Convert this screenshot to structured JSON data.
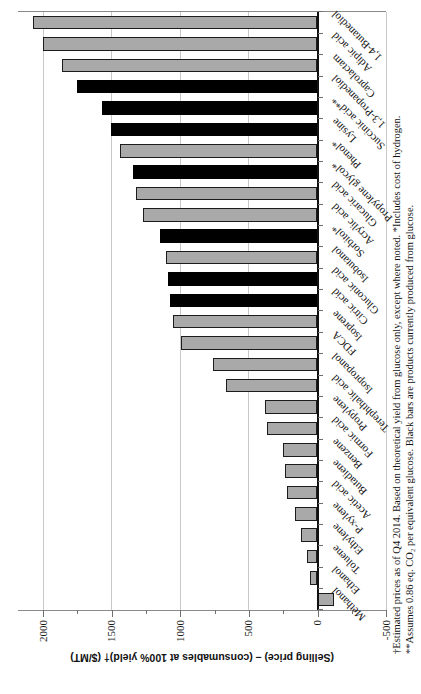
{
  "chart_data": {
    "type": "bar",
    "title": "",
    "ylabel": "(Selling price) – (consumables at 100% yield)† ($/MT)",
    "ylim": [
      -500,
      2150
    ],
    "value_axis": {
      "tick_labels": [
        "2000",
        "1500",
        "1000",
        "500",
        "0",
        "-500"
      ],
      "tick_values": [
        2000,
        1500,
        1000,
        500,
        0,
        -500
      ],
      "minor_tick_values": [
        1750,
        1250,
        750,
        250,
        -250
      ],
      "grid": "on"
    },
    "categories": [
      "Methanol",
      "Ethanol",
      "Toluene",
      "Ethylene",
      "P-xylene",
      "Acetic acid",
      "Butadiene",
      "Benzene",
      "Formic acid",
      "Propylene",
      "Terephthalic acid",
      "Isopropanol",
      "FDCA",
      "Isoprene",
      "Citric acid",
      "Gluconic acid",
      "Isobutanol",
      "Sorbitol*",
      "Acrylic acid",
      "Glucaric acid",
      "Propylene glycol*",
      "Phenol*",
      "Lysine",
      "Succinic acid**",
      "1,3-Propanediol",
      "Caprolactam",
      "Adipic acid",
      "1,4-Butanediol"
    ],
    "values": [
      -120,
      55,
      75,
      120,
      165,
      220,
      235,
      250,
      370,
      385,
      665,
      760,
      995,
      1055,
      1075,
      1090,
      1105,
      1150,
      1270,
      1325,
      1345,
      1440,
      1505,
      1570,
      1755,
      1865,
      2000,
      2075
    ],
    "black_bar": [
      false,
      false,
      false,
      false,
      false,
      false,
      false,
      false,
      false,
      false,
      false,
      false,
      false,
      false,
      true,
      true,
      false,
      true,
      false,
      false,
      true,
      false,
      true,
      true,
      true,
      false,
      false,
      false
    ],
    "colors": {
      "gray_bar": "#a9a9a9",
      "black_bar": "#000000",
      "gridline": "#c9c9c9",
      "axis_line": "#8a8a8a",
      "zero_axis": "#111111"
    }
  },
  "footnotes": {
    "line1": "†Estimated prices as of Q4 2014.  Based on theoretical yield from glucose only, except where noted.  *Includes cost of hydrogen.",
    "line2": "**Assumes 0.86 eq. CO₂ per equivalent glucose.  Black bars are products currently produced from glucose."
  }
}
